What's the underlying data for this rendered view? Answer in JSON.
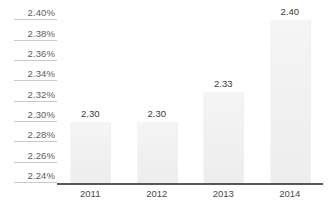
{
  "chart_data": {
    "type": "bar",
    "title": "",
    "subtitle": "",
    "xlabel": "",
    "ylabel": "",
    "categories": [
      "2011",
      "2012",
      "2013",
      "2014"
    ],
    "values": [
      2.3,
      2.3,
      2.33,
      2.4
    ],
    "data_labels": [
      "2.30",
      "2.30",
      "2.33",
      "2.40"
    ],
    "ylim": [
      2.24,
      2.42
    ],
    "ytick_values": [
      2.24,
      2.26,
      2.28,
      2.3,
      2.32,
      2.34,
      2.36,
      2.38,
      2.4,
      2.42
    ],
    "ytick_labels": [
      "2.24%",
      "2.26%",
      "2.28%",
      "2.30%",
      "2.32%",
      "2.34%",
      "2.36%",
      "2.38%",
      "2.40%",
      "2.42%"
    ],
    "grid": true,
    "legend": null,
    "legend_position": "none",
    "annotations": [],
    "colors": {
      "bar_fill": "#f1f1f1",
      "axis_line": "#595959",
      "gridline": "#c9c9c9",
      "ytick_text": "#5c5c5c",
      "xtick_text": "#4a4a4a",
      "data_label_text": "#3b3b3b",
      "background": "#ffffff"
    }
  }
}
